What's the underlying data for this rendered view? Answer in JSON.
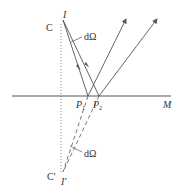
{
  "diagram": {
    "labels": {
      "C": "C",
      "I": "I",
      "C_prime": "C'",
      "I_prime": "I'",
      "M": "M",
      "P1": "P",
      "P1_sub": "1",
      "P2": "P",
      "P2_sub": "2",
      "dOmega_top": "dΩ",
      "dOmega_bottom": "dΩ"
    },
    "colors": {
      "line": "#555555",
      "dotted": "#888888",
      "mirror": "#555555",
      "text": "#333333"
    }
  }
}
